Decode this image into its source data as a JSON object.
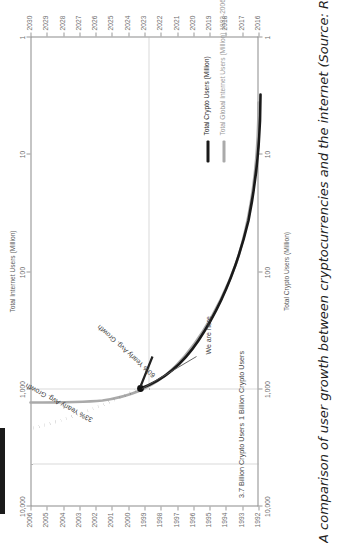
{
  "caption": {
    "text": "A comparison of user growth between cryptocurrencies and the internet (Source: Raoul Pal)",
    "footnote_marker": "81"
  },
  "chart_data": {
    "type": "line",
    "title": "A comparison of user growth between cryptocurrencies and the internet",
    "orientation": "rotated-90-ccw",
    "grid": false,
    "legend_position": "bottom-right",
    "axes": {
      "x_bottom_label": "Crypto years",
      "x_bottom_ticks": [
        "2016",
        "2017",
        "2018",
        "2019",
        "2020",
        "2021",
        "2022",
        "2023",
        "2024",
        "2025",
        "2026",
        "2027",
        "2028",
        "2029",
        "2030"
      ],
      "x_top_label": "Internet years",
      "x_top_ticks": [
        "1992",
        "1993",
        "1994",
        "1995",
        "1996",
        "1997",
        "1998",
        "1999",
        "2000",
        "2001",
        "2002",
        "2003",
        "2004",
        "2005",
        "2006"
      ],
      "y_left_label": "Total Crypto Users (Million)",
      "y_left_ticks": [
        "1",
        "10",
        "100",
        "1,000",
        "10,000"
      ],
      "y_left_scale": "log",
      "y_left_lim": [
        1,
        10000
      ],
      "y_right_label": "Total Internet Users (Million)",
      "y_right_ticks": [
        "1",
        "10",
        "100",
        "1,000",
        "10,000"
      ],
      "y_right_scale": "log",
      "y_right_lim": [
        1,
        10000
      ]
    },
    "series": [
      {
        "name": "Total Crypto Users (Million)",
        "color": "#1a1a1a",
        "style": "solid",
        "width": 2.6,
        "x": [
          "2016",
          "2017",
          "2018",
          "2019",
          "2020",
          "2021",
          "2022",
          "2023"
        ],
        "values": [
          5,
          12,
          35,
          80,
          150,
          300,
          600,
          1000
        ],
        "note": "historical / we-are-here segment"
      },
      {
        "name": "Total Global Internet Users (Million) 1992-2006",
        "color": "#aaaaaa",
        "style": "solid",
        "width": 2.6,
        "x": [
          "1992",
          "1993",
          "1994",
          "1995",
          "1996",
          "1997",
          "1998",
          "1999",
          "2000",
          "2001",
          "2002",
          "2003",
          "2004",
          "2005",
          "2006"
        ],
        "values": [
          4,
          9,
          20,
          44,
          88,
          150,
          250,
          400,
          600,
          800,
          950,
          1050,
          1150,
          1250,
          1350
        ]
      },
      {
        "name": "Crypto projection",
        "color": "#111111",
        "style": "dotted",
        "width": 3.2,
        "x": [
          "2023",
          "2024",
          "2025",
          "2026",
          "2027",
          "2028",
          "2029",
          "2030"
        ],
        "values": [
          1000,
          1500,
          2000,
          2500,
          3000,
          3350,
          3600,
          3700
        ]
      }
    ],
    "reference_lines": [
      {
        "label": "3.7 Billion Crypto Users",
        "value": 3700,
        "axis": "y_left",
        "style": "dotted"
      },
      {
        "label": "1 Billion Crypto Users",
        "value": 1000,
        "axis": "y_left",
        "style": "dotted"
      }
    ],
    "annotations": [
      {
        "label": "33% Yearly Avg. Growth",
        "target": "crypto-projection"
      },
      {
        "label": "60% Yearly Avg. Growth",
        "target": "crypto-historical"
      },
      {
        "label": "We are here",
        "target": "current-point",
        "has_leader": true
      }
    ],
    "legend": [
      {
        "label": "Total Crypto Users (Million)",
        "color": "#1a1a1a"
      },
      {
        "label": "Total Global Internet Users (Million) 1992-2006",
        "color": "#aaaaaa"
      }
    ]
  }
}
